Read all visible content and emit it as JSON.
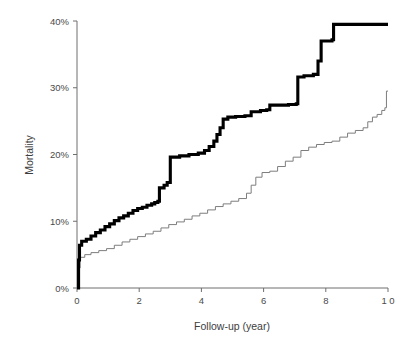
{
  "chart_data": {
    "type": "line",
    "title": "",
    "subtitle": "",
    "xlabel": "Follow-up (year)",
    "ylabel": "Mortality",
    "xlim": [
      0,
      10
    ],
    "ylim": [
      0,
      40
    ],
    "xticks": [
      0,
      2,
      4,
      6,
      8,
      10
    ],
    "xtick_labels": [
      "0",
      "2",
      "4",
      "6",
      "8",
      "1 0"
    ],
    "yticks": [
      0,
      10,
      20,
      30,
      40
    ],
    "ytick_labels": [
      "0%",
      "10%",
      "20%",
      "30%",
      "40%"
    ],
    "grid": false,
    "legend_position": "none",
    "annotations": [],
    "series": [
      {
        "name": "upper-curve",
        "style": "step",
        "line_width": "thick",
        "color": "#000000",
        "final_value": 39.5,
        "points": [
          [
            0.0,
            0.0
          ],
          [
            0.05,
            4.2
          ],
          [
            0.08,
            6.4
          ],
          [
            0.15,
            7.0
          ],
          [
            0.3,
            7.3
          ],
          [
            0.45,
            7.8
          ],
          [
            0.6,
            8.3
          ],
          [
            0.75,
            8.7
          ],
          [
            0.9,
            9.2
          ],
          [
            1.05,
            9.6
          ],
          [
            1.2,
            10.1
          ],
          [
            1.35,
            10.5
          ],
          [
            1.5,
            10.8
          ],
          [
            1.65,
            11.2
          ],
          [
            1.8,
            11.6
          ],
          [
            1.95,
            11.9
          ],
          [
            2.1,
            12.1
          ],
          [
            2.25,
            12.4
          ],
          [
            2.4,
            12.6
          ],
          [
            2.5,
            12.8
          ],
          [
            2.6,
            13.0
          ],
          [
            2.65,
            15.0
          ],
          [
            2.8,
            15.4
          ],
          [
            2.9,
            15.8
          ],
          [
            3.0,
            19.6
          ],
          [
            3.3,
            19.8
          ],
          [
            3.6,
            20.0
          ],
          [
            3.9,
            20.2
          ],
          [
            4.1,
            20.6
          ],
          [
            4.25,
            21.2
          ],
          [
            4.4,
            22.0
          ],
          [
            4.5,
            23.0
          ],
          [
            4.6,
            24.0
          ],
          [
            4.7,
            25.3
          ],
          [
            4.85,
            25.6
          ],
          [
            5.1,
            25.7
          ],
          [
            5.4,
            25.8
          ],
          [
            5.6,
            26.4
          ],
          [
            5.9,
            26.6
          ],
          [
            6.1,
            26.7
          ],
          [
            6.2,
            27.4
          ],
          [
            6.8,
            27.5
          ],
          [
            7.05,
            27.6
          ],
          [
            7.1,
            31.6
          ],
          [
            7.3,
            31.8
          ],
          [
            7.6,
            32.0
          ],
          [
            7.75,
            34.0
          ],
          [
            7.85,
            37.0
          ],
          [
            8.2,
            37.2
          ],
          [
            8.25,
            39.5
          ],
          [
            10.0,
            39.5
          ]
        ]
      },
      {
        "name": "lower-curve",
        "style": "step",
        "line_width": "thin",
        "color": "#7d7d7d",
        "final_value": 29.5,
        "points": [
          [
            0.0,
            0.0
          ],
          [
            0.05,
            3.0
          ],
          [
            0.1,
            4.6
          ],
          [
            0.25,
            5.0
          ],
          [
            0.45,
            5.3
          ],
          [
            0.7,
            5.6
          ],
          [
            0.95,
            5.9
          ],
          [
            1.2,
            6.4
          ],
          [
            1.45,
            6.9
          ],
          [
            1.7,
            7.3
          ],
          [
            1.95,
            7.7
          ],
          [
            2.2,
            8.1
          ],
          [
            2.45,
            8.5
          ],
          [
            2.7,
            9.0
          ],
          [
            2.95,
            9.5
          ],
          [
            3.2,
            9.9
          ],
          [
            3.45,
            10.3
          ],
          [
            3.7,
            10.8
          ],
          [
            3.95,
            11.2
          ],
          [
            4.2,
            11.7
          ],
          [
            4.45,
            12.2
          ],
          [
            4.7,
            12.6
          ],
          [
            4.95,
            13.0
          ],
          [
            5.2,
            13.4
          ],
          [
            5.45,
            14.2
          ],
          [
            5.6,
            15.4
          ],
          [
            5.75,
            16.6
          ],
          [
            5.95,
            17.3
          ],
          [
            6.2,
            17.5
          ],
          [
            6.45,
            18.2
          ],
          [
            6.7,
            19.0
          ],
          [
            6.95,
            19.6
          ],
          [
            7.2,
            20.6
          ],
          [
            7.45,
            21.1
          ],
          [
            7.7,
            21.5
          ],
          [
            7.95,
            21.8
          ],
          [
            8.2,
            22.0
          ],
          [
            8.45,
            22.6
          ],
          [
            8.7,
            23.2
          ],
          [
            8.95,
            23.6
          ],
          [
            9.2,
            24.0
          ],
          [
            9.35,
            24.9
          ],
          [
            9.5,
            25.6
          ],
          [
            9.65,
            26.0
          ],
          [
            9.8,
            26.6
          ],
          [
            9.9,
            27.0
          ],
          [
            9.95,
            29.5
          ],
          [
            10.0,
            29.5
          ]
        ]
      }
    ]
  }
}
